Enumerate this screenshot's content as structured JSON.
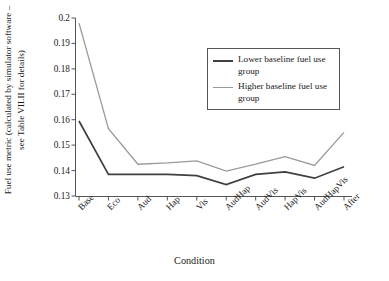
{
  "chart_data": {
    "type": "line",
    "title": "",
    "xlabel": "Condition",
    "ylabel": "Fuel use metric (calculated by simulator software – see Table VII.II for details)",
    "categories": [
      "Base",
      "Eco",
      "Aud",
      "Hap",
      "Vis",
      "AudHap",
      "AudVis",
      "HapVis",
      "AudHapVis",
      "After"
    ],
    "ylim": [
      0.13,
      0.2
    ],
    "yticks": [
      "0.13",
      "0.14",
      "0.15",
      "0.16",
      "0.17",
      "0.18",
      "0.19",
      "0.2"
    ],
    "grid": false,
    "legend_position": "upper right",
    "series": [
      {
        "name": "Lower baseline fuel use group",
        "color": "#404040",
        "values": [
          0.1595,
          0.1385,
          0.1385,
          0.1385,
          0.138,
          0.1345,
          0.1385,
          0.1395,
          0.137,
          0.1415
        ]
      },
      {
        "name": "Higher baseline fuel use group",
        "color": "#9a9a9a",
        "values": [
          0.198,
          0.1565,
          0.1425,
          0.143,
          0.1438,
          0.1398,
          0.1425,
          0.1455,
          0.142,
          0.155
        ]
      }
    ]
  },
  "legend": {
    "items": [
      {
        "label": "Lower baseline fuel use group"
      },
      {
        "label": "Higher baseline fuel use group"
      }
    ]
  },
  "axes": {
    "y_title": "Fuel use metric (calculated by simulator software – see Table VII.II for details)",
    "x_title": "Condition"
  }
}
